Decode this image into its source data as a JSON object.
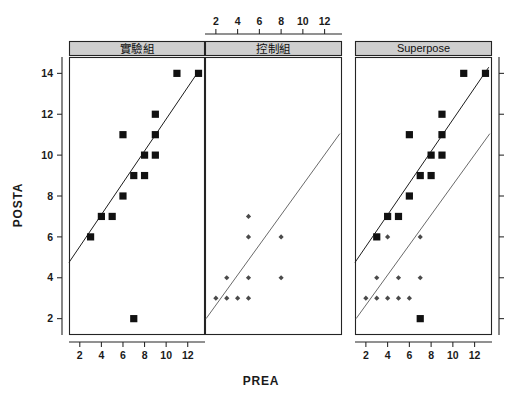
{
  "chart_data": {
    "type": "scatter",
    "title": "",
    "xlabel": "PREA",
    "ylabel": "POSTA",
    "xlim": [
      1,
      13.6
    ],
    "ylim": [
      1.2,
      14.8
    ],
    "xticks": [
      2,
      4,
      6,
      8,
      10,
      12
    ],
    "yticks": [
      2,
      4,
      6,
      8,
      10,
      12,
      14
    ],
    "grid": false,
    "legend_position": "none",
    "layout": "trellis-3-panel",
    "panels": [
      {
        "id": "panel-treatment",
        "label": "實驗組",
        "label_romanized": "Experimental Group",
        "strip_color": "#cfcfcf",
        "axis_position": "bottom",
        "series": [
          {
            "name": "實驗組",
            "marker": "filled-square",
            "color": "#111111",
            "points": [
              {
                "x": 3,
                "y": 6
              },
              {
                "x": 4,
                "y": 7
              },
              {
                "x": 5,
                "y": 7
              },
              {
                "x": 6,
                "y": 8
              },
              {
                "x": 6,
                "y": 11
              },
              {
                "x": 7,
                "y": 2
              },
              {
                "x": 7,
                "y": 9
              },
              {
                "x": 8,
                "y": 9
              },
              {
                "x": 8,
                "y": 10
              },
              {
                "x": 9,
                "y": 10
              },
              {
                "x": 9,
                "y": 11
              },
              {
                "x": 9,
                "y": 12
              },
              {
                "x": 11,
                "y": 14
              },
              {
                "x": 13,
                "y": 14
              }
            ]
          }
        ],
        "fit_lines": [
          {
            "name": "treatment-regression",
            "color": "#1c1c1c",
            "x0": 1.0,
            "y0": 4.75,
            "x1": 13.0,
            "y1": 14.1
          }
        ]
      },
      {
        "id": "panel-control",
        "label": "控制組",
        "label_romanized": "Control Group",
        "strip_color": "#cfcfcf",
        "axis_position": "top",
        "series": [
          {
            "name": "控制組",
            "marker": "small-diamond",
            "color": "#4a4a4a",
            "points": [
              {
                "x": 2,
                "y": 3
              },
              {
                "x": 3,
                "y": 3
              },
              {
                "x": 3,
                "y": 4
              },
              {
                "x": 4,
                "y": 3
              },
              {
                "x": 5,
                "y": 3
              },
              {
                "x": 5,
                "y": 4
              },
              {
                "x": 5,
                "y": 6
              },
              {
                "x": 5,
                "y": 7
              },
              {
                "x": 8,
                "y": 4
              },
              {
                "x": 8,
                "y": 6
              }
            ]
          }
        ],
        "fit_lines": [
          {
            "name": "control-regression",
            "color": "#6a6a6a",
            "x0": 1.1,
            "y0": 2.0,
            "x1": 13.4,
            "y1": 11.05
          }
        ]
      },
      {
        "id": "panel-superpose",
        "label": "Superpose",
        "strip_color": "#cfcfcf",
        "axis_position": "bottom",
        "series": [
          {
            "name": "實驗組",
            "marker": "filled-square",
            "color": "#111111",
            "points": [
              {
                "x": 3,
                "y": 6
              },
              {
                "x": 4,
                "y": 7
              },
              {
                "x": 5,
                "y": 7
              },
              {
                "x": 6,
                "y": 8
              },
              {
                "x": 6,
                "y": 11
              },
              {
                "x": 7,
                "y": 2
              },
              {
                "x": 7,
                "y": 9
              },
              {
                "x": 8,
                "y": 9
              },
              {
                "x": 8,
                "y": 10
              },
              {
                "x": 9,
                "y": 10
              },
              {
                "x": 9,
                "y": 11
              },
              {
                "x": 9,
                "y": 12
              },
              {
                "x": 11,
                "y": 14
              },
              {
                "x": 13,
                "y": 14
              }
            ]
          },
          {
            "name": "控制組",
            "marker": "small-diamond",
            "color": "#4a4a4a",
            "points": [
              {
                "x": 2,
                "y": 3
              },
              {
                "x": 3,
                "y": 3
              },
              {
                "x": 3,
                "y": 4
              },
              {
                "x": 4,
                "y": 3
              },
              {
                "x": 4,
                "y": 6
              },
              {
                "x": 5,
                "y": 3
              },
              {
                "x": 5,
                "y": 4
              },
              {
                "x": 6,
                "y": 3
              },
              {
                "x": 7,
                "y": 4
              },
              {
                "x": 7,
                "y": 6
              }
            ]
          }
        ],
        "fit_lines": [
          {
            "name": "treatment-regression",
            "color": "#1c1c1c",
            "x0": 1.0,
            "y0": 4.75,
            "x1": 13.3,
            "y1": 14.3
          },
          {
            "name": "control-regression",
            "color": "#6a6a6a",
            "x0": 1.1,
            "y0": 2.0,
            "x1": 13.4,
            "y1": 11.05
          }
        ]
      }
    ]
  }
}
